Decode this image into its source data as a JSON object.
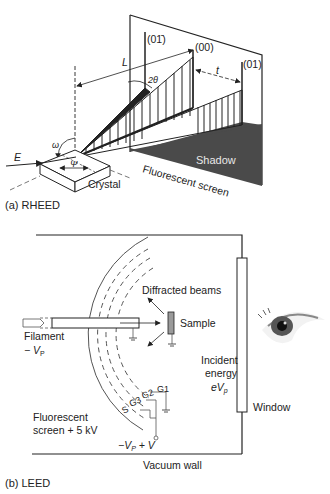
{
  "figure": {
    "panels": [
      {
        "id": "rheed",
        "caption": "(a) RHEED",
        "labels": {
          "beam_01bar": "(01̄)",
          "beam_00": "(00)",
          "beam_01": "(01)",
          "distance_L": "L",
          "angle_2theta": "2θ",
          "spacing_t": "t",
          "angle_omega": "ω",
          "angle_psi": "Ψ",
          "energy_E": "E",
          "crystal": "Crystal",
          "shadow": "Shadow",
          "screen": "Fluorescent screen"
        }
      },
      {
        "id": "leed",
        "caption": "(b) LEED",
        "labels": {
          "diffracted_beams": "Diffracted beams",
          "sample": "Sample",
          "filament": "Filament",
          "filament_voltage": "− V",
          "filament_voltage_sub": "P",
          "incident_energy_1": "Incident",
          "incident_energy_2": "energy",
          "incident_energy_3": "eV",
          "incident_energy_sub": "p",
          "window": "Window",
          "grid_g1": "G1",
          "grid_g2": "G2",
          "grid_g3": "G3",
          "grid_s": "S",
          "screen_1": "Fluorescent",
          "screen_2": "screen + 5 kV",
          "retard_voltage_a": "−V",
          "retard_voltage_sub": "P",
          "retard_voltage_b": " + V",
          "vacuum_wall": "Vacuum wall"
        }
      }
    ]
  },
  "colors": {
    "line": "#222222",
    "shadow": "#4a4a4a",
    "sample_fill": "#9a9a9a",
    "dashed": "#555555"
  }
}
